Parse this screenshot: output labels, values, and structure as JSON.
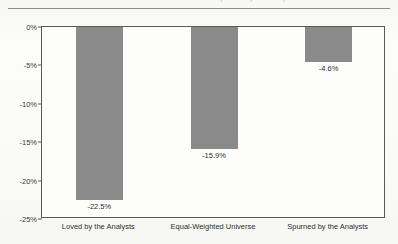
{
  "figure": {
    "clipped_title": "Performance of Stocks Loved and Spurned by the Analysts"
  },
  "chart_data": {
    "type": "bar",
    "title": "",
    "xlabel": "",
    "ylabel": "",
    "categories": [
      "Loved by the Analysts",
      "Equal-Weighted Universe",
      "Spurned by the Analysts"
    ],
    "values": [
      -22.5,
      -15.9,
      -4.6
    ],
    "value_labels": [
      "-22.5%",
      "-15.9%",
      "-4.6%"
    ],
    "ylim": [
      -25,
      0
    ],
    "yticks": [
      0,
      -5,
      -10,
      -15,
      -20,
      -25
    ],
    "ytick_labels": [
      "0%",
      "-5%",
      "-10%",
      "-15%",
      "-20%",
      "-25%"
    ],
    "grid": false,
    "legend": false,
    "bar_color": "#8a8a8a",
    "axis_color": "#5a5a5a"
  }
}
